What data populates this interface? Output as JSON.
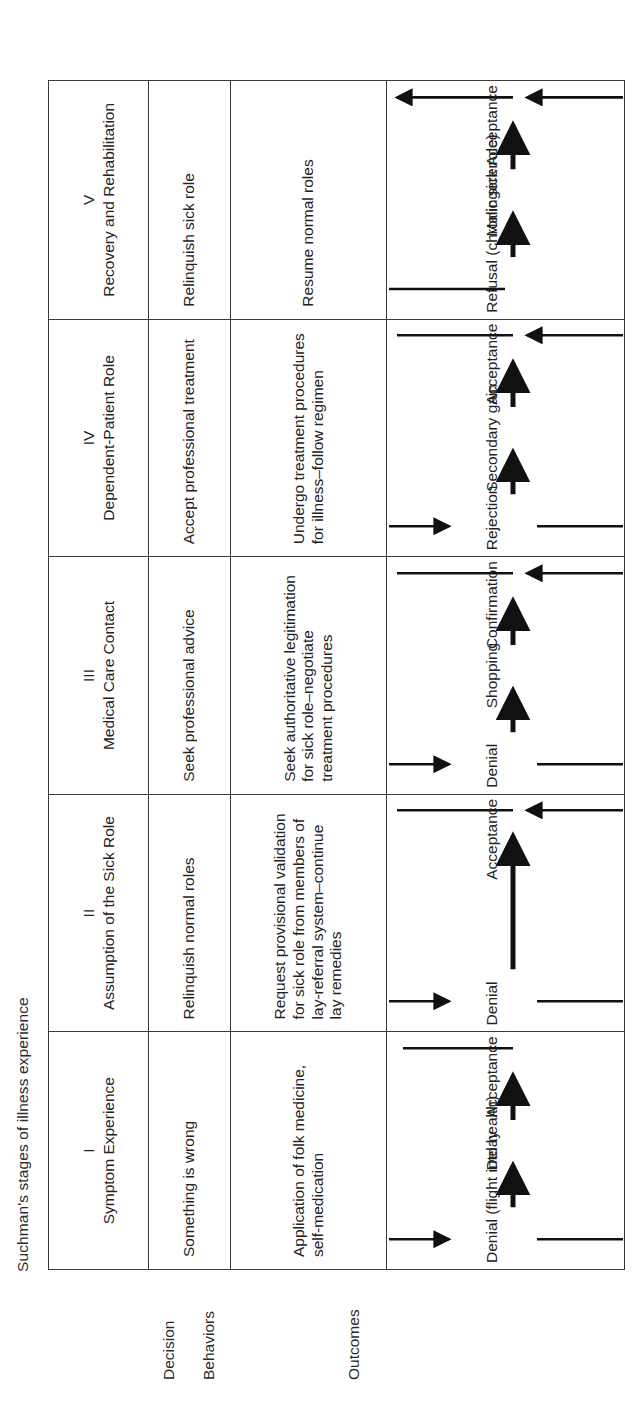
{
  "figure": {
    "title": "Suchman's stages of illness experience",
    "orientation": "rotated-90-ccw",
    "line_color": "#3a3a3a",
    "text_color": "#222222"
  },
  "row_labels": {
    "decision": "Decision",
    "behaviors": "Behaviors",
    "outcomes": "Outcomes"
  },
  "stages": [
    {
      "numeral": "I",
      "name": "Symptom Experience",
      "decision": "Something is wrong",
      "behaviors": "Application of folk medicine, self-medication",
      "outcomes": {
        "start": "Denial (flight into health)",
        "middle": "Delay",
        "end": "Acceptance"
      }
    },
    {
      "numeral": "II",
      "name": "Assumption of the Sick Role",
      "decision": "Relinquish normal roles",
      "behaviors": "Request provisional validation for sick role from members of lay-referral system–continue lay remedies",
      "outcomes": {
        "start": "Denial",
        "middle": "",
        "end": "Acceptance"
      }
    },
    {
      "numeral": "III",
      "name": "Medical Care Contact",
      "decision": "Seek professional advice",
      "behaviors": "Seek authoritative legitimation for sick role–negotiate treatment procedures",
      "outcomes": {
        "start": "Denial",
        "middle": "Shopping",
        "end": "Confirmation"
      }
    },
    {
      "numeral": "IV",
      "name": "Dependent-Patient Role",
      "decision": "Accept professional treatment",
      "behaviors": "Undergo treatment procedures for illness–follow regimen",
      "outcomes": {
        "start": "Rejection",
        "middle": "Secondary gain",
        "end": "Acceptance"
      }
    },
    {
      "numeral": "V",
      "name": "Recovery and Rehabilitation",
      "decision": "Relinquish sick role",
      "behaviors": "Resume normal roles",
      "outcomes": {
        "start": "Refusal (chronic sick role)",
        "middle": "Malingerer",
        "end": "Acceptance"
      }
    }
  ]
}
